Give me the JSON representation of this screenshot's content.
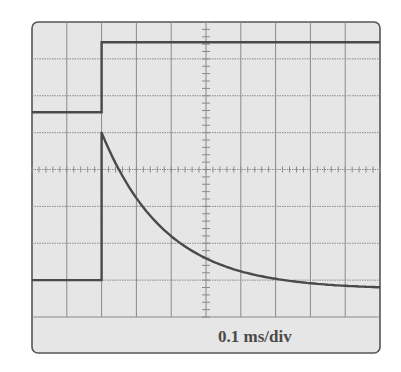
{
  "chart_data": {
    "type": "line",
    "title": "",
    "xlabel": "",
    "ylabel": "",
    "annotation": "0.1 ms/div",
    "grid": {
      "x_divisions": 10,
      "y_divisions": 8,
      "minor_ticks_per_div": 5
    },
    "x_unit": "divisions (0.1 ms/div)",
    "y_unit": "divisions",
    "xlim": [
      0,
      10
    ],
    "ylim": [
      -4,
      4
    ],
    "series": [
      {
        "name": "input-step",
        "x": [
          0,
          2,
          2,
          10
        ],
        "upper_trace_y": [
          1.55,
          1.55,
          3.45,
          3.45
        ],
        "lower_trace_y": [
          -3.0,
          -3.0,
          1.0,
          1.0
        ]
      },
      {
        "name": "exponential-decay",
        "x": [
          2,
          2.3,
          2.6,
          3.0,
          3.5,
          4.0,
          4.9,
          5.0,
          6.0,
          7.0,
          8.0,
          9.0,
          10.0
        ],
        "y": [
          1.0,
          0.55,
          0.0,
          -0.45,
          -0.95,
          -1.3,
          -1.75,
          -1.8,
          -2.2,
          -2.5,
          -2.7,
          -2.85,
          -2.97
        ]
      }
    ],
    "colors": {
      "trace": "#4a4a4a",
      "grid": "#8a8a8a",
      "screen": "#e6e6e6",
      "border": "#555555"
    }
  },
  "screen": {
    "scale_label": "0.1 ms/div"
  }
}
